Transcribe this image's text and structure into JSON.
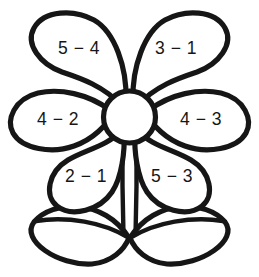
{
  "worksheet": {
    "title": "Flower Subtraction Coloring Page",
    "background_color": "#ffffff",
    "outline_color": "#161616",
    "fill_color": "#ffffff"
  },
  "flower": {
    "center": {
      "name": "flower-center",
      "label": ""
    },
    "petals": [
      {
        "position": "top-left",
        "label": "5 − 4",
        "minuend": 5,
        "subtrahend": 4,
        "answer": 1
      },
      {
        "position": "top-right",
        "label": "3 − 1",
        "minuend": 3,
        "subtrahend": 1,
        "answer": 2
      },
      {
        "position": "middle-left",
        "label": "4 − 2",
        "minuend": 4,
        "subtrahend": 2,
        "answer": 2
      },
      {
        "position": "middle-right",
        "label": "4 − 3",
        "minuend": 4,
        "subtrahend": 3,
        "answer": 1
      },
      {
        "position": "bottom-left",
        "label": "2 − 1",
        "minuend": 2,
        "subtrahend": 1,
        "answer": 1
      },
      {
        "position": "bottom-right",
        "label": "5 − 3",
        "minuend": 5,
        "subtrahend": 3,
        "answer": 2
      }
    ],
    "stem": {
      "name": "flower-stem"
    },
    "leaves": [
      {
        "position": "left",
        "name": "leaf-left"
      },
      {
        "position": "right",
        "name": "leaf-right"
      }
    ]
  }
}
